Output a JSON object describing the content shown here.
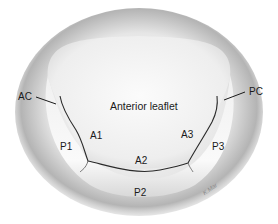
{
  "diagram": {
    "labels": {
      "anterior_leaflet": "Anterior leaflet",
      "ac": "AC",
      "pc": "PC",
      "a1": "A1",
      "a2": "A2",
      "a3": "A3",
      "p1": "P1",
      "p2": "P2",
      "p3": "P3"
    },
    "signature": "K.Mar",
    "colors": {
      "background": "#ffffff",
      "annulus_shadow": "#9a9a9a",
      "leaflet": "#f3f3f3",
      "outline": "#2a2a2a",
      "text": "#1a1a1a"
    }
  }
}
